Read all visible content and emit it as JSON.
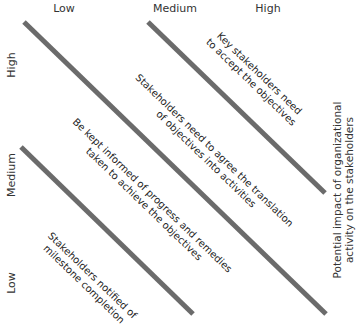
{
  "columns": {
    "low": "Low",
    "medium": "Medium",
    "high": "High"
  },
  "rows": {
    "high": "High",
    "medium": "Medium",
    "low": "Low"
  },
  "side_axis": {
    "line1": "Potential impact of organizational",
    "line2": "activity on the stakeholders"
  },
  "bands": [
    {
      "line1": "Key stakeholders need",
      "line2": "to accept the objectives"
    },
    {
      "line1": "Stakeholders need to agree the translation",
      "line2": "of objectives into activities"
    },
    {
      "line1": "Be kept informed of progress and remedies",
      "line2": "taken to achieve the objectives"
    },
    {
      "line1": "Stakeholders notified of",
      "line2": "milestone completion"
    }
  ],
  "colors": {
    "divider": "#6b6b6b",
    "text": "#222222"
  }
}
